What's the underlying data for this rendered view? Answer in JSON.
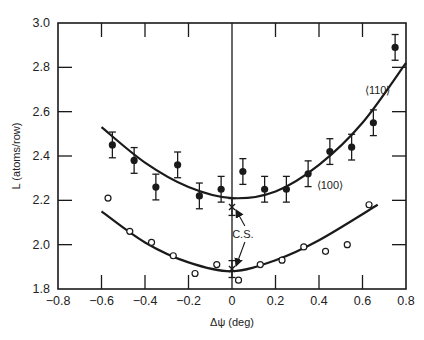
{
  "chart_data": {
    "type": "scatter",
    "title": "",
    "xlabel": "Δψ (deg)",
    "ylabel": "L (atoms/row)",
    "xlim": [
      -0.8,
      0.8
    ],
    "ylim": [
      1.8,
      3.0
    ],
    "xticks": [
      -0.8,
      -0.6,
      -0.4,
      -0.2,
      0,
      0.2,
      0.4,
      0.6,
      0.8
    ],
    "xtick_labels": [
      "−0.8",
      "−0.6",
      "−0.4",
      "−0.2",
      "0",
      "0.2",
      "0.4",
      "0.6",
      "0.8"
    ],
    "yticks": [
      1.8,
      2.0,
      2.2,
      2.4,
      2.6,
      2.8,
      3.0
    ],
    "ytick_labels": [
      "1.8",
      "2.0",
      "2.2",
      "2.4",
      "2.6",
      "2.8",
      "3.0"
    ],
    "grid": false,
    "vertical_reference_line_x": 0,
    "series": [
      {
        "name": "⟨110⟩",
        "marker": "filled-circle-with-errorbars",
        "x": [
          -0.55,
          -0.45,
          -0.35,
          -0.25,
          -0.15,
          -0.05,
          0.05,
          0.15,
          0.25,
          0.35,
          0.45,
          0.55,
          0.65,
          0.75
        ],
        "y": [
          2.45,
          2.38,
          2.26,
          2.36,
          2.22,
          2.25,
          2.33,
          2.25,
          2.25,
          2.32,
          2.42,
          2.44,
          2.55,
          2.89
        ],
        "yerr": 0.04,
        "fit_curve": {
          "x": [
            -0.6,
            -0.4,
            -0.2,
            0.0,
            0.2,
            0.4,
            0.6,
            0.8
          ],
          "y": [
            2.53,
            2.37,
            2.26,
            2.21,
            2.24,
            2.36,
            2.55,
            2.82
          ]
        }
      },
      {
        "name": "⟨100⟩",
        "marker": "open-circle",
        "x": [
          -0.57,
          -0.47,
          -0.37,
          -0.27,
          -0.17,
          -0.07,
          0.03,
          0.13,
          0.23,
          0.33,
          0.43,
          0.53,
          0.63
        ],
        "y": [
          2.21,
          2.06,
          2.01,
          1.95,
          1.87,
          1.91,
          1.84,
          1.91,
          1.93,
          1.99,
          1.97,
          2.0,
          2.18
        ],
        "fit_curve": {
          "x": [
            -0.6,
            -0.4,
            -0.2,
            0.0,
            0.2,
            0.4,
            0.67
          ],
          "y": [
            2.15,
            2.01,
            1.92,
            1.88,
            1.93,
            2.02,
            2.18
          ]
        }
      },
      {
        "name": "C.S.",
        "marker": "x-with-errorbars",
        "x": [
          0,
          0
        ],
        "y": [
          2.17,
          1.89
        ],
        "yerr": 0.02
      }
    ],
    "annotations": [
      {
        "text": "⟨110⟩",
        "x": 0.67,
        "y": 2.68
      },
      {
        "text": "⟨100⟩",
        "x": 0.45,
        "y": 2.25
      },
      {
        "text": "C.S.",
        "x": 0.05,
        "y": 2.03,
        "arrows_to": [
          [
            0,
            2.17
          ],
          [
            0,
            1.89
          ]
        ]
      }
    ]
  }
}
